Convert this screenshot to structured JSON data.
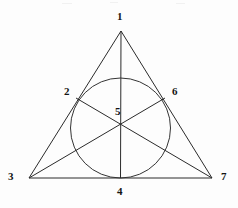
{
  "figure": {
    "background_color": "#fdfdfd",
    "stroke_color": "#2b2b2b",
    "label_color": "#141414",
    "width": 238,
    "height": 208
  },
  "points": [
    {
      "id": "1",
      "label": "1",
      "name": "apex-vertex",
      "x": 121,
      "y": 31,
      "label_x": 117,
      "label_y": 11,
      "on_circle": false
    },
    {
      "id": "2",
      "label": "2",
      "name": "left-tangent-point",
      "x": 76,
      "y": 98,
      "label_x": 64,
      "label_y": 86,
      "on_circle": true
    },
    {
      "id": "3",
      "label": "3",
      "name": "bottom-left-vertex",
      "x": 29,
      "y": 178,
      "label_x": 8,
      "label_y": 171,
      "on_circle": false
    },
    {
      "id": "4",
      "label": "4",
      "name": "base-tangent-point",
      "x": 120.5,
      "y": 178,
      "label_x": 117,
      "label_y": 186,
      "on_circle": true
    },
    {
      "id": "5",
      "label": "5",
      "name": "cevian-intersection",
      "x": 120.5,
      "y": 123,
      "label_x": 115,
      "label_y": 106,
      "on_circle": false
    },
    {
      "id": "6",
      "label": "6",
      "name": "right-tangent-point",
      "x": 165,
      "y": 98,
      "label_x": 172,
      "label_y": 86,
      "on_circle": true
    },
    {
      "id": "7",
      "label": "7",
      "name": "bottom-right-vertex",
      "x": 212,
      "y": 178,
      "label_x": 221,
      "label_y": 171,
      "on_circle": false
    }
  ],
  "triangle": {
    "name": "outer-triangle",
    "vertices": [
      "1",
      "3",
      "7"
    ],
    "path": "M 121 31 L 29 178 L 212 178 Z"
  },
  "incircle": {
    "name": "inscribed-circle",
    "center_x": 120.5,
    "center_y": 128,
    "radius": 50,
    "tangent_points": [
      "2",
      "4",
      "6"
    ]
  },
  "cevians": [
    {
      "name": "cevian-1-to-4",
      "from": "1",
      "to": "4",
      "path": "M 121 31 L 120.5 178"
    },
    {
      "name": "cevian-3-to-6",
      "from": "3",
      "to": "6",
      "path": "M 29 178 L 165 98"
    },
    {
      "name": "cevian-7-to-2",
      "from": "7",
      "to": "2",
      "path": "M 212 178 L 76 98"
    }
  ],
  "scan_artifacts": [
    {
      "x": 62,
      "y": 3,
      "width": 10
    },
    {
      "x": 110,
      "y": 2,
      "width": 8
    },
    {
      "x": 176,
      "y": 3,
      "width": 9
    }
  ]
}
